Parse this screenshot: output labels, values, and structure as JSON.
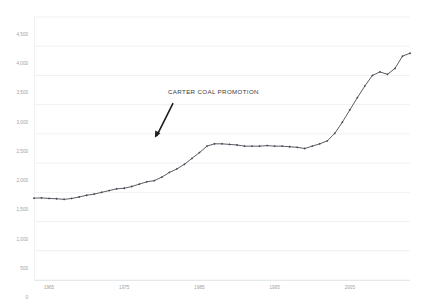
{
  "chart_data": {
    "type": "line",
    "title": "",
    "xlabel": "",
    "ylabel": "",
    "ylim": [
      0,
      4500
    ],
    "xlim": [
      1963,
      2013
    ],
    "grid": true,
    "legend": false,
    "yticks": [
      "0",
      "500",
      "1,000",
      "1,500",
      "2,000",
      "2,500",
      "3,000",
      "3,500",
      "4,000",
      "4,500"
    ],
    "ytick_values": [
      0,
      500,
      1000,
      1500,
      2000,
      2500,
      3000,
      3500,
      4000,
      4500
    ],
    "xticks": [
      "1965",
      "1975",
      "1985",
      "1995",
      "2005"
    ],
    "xtick_values": [
      1965,
      1975,
      1985,
      1995,
      2005
    ],
    "marker": "diamond",
    "line_color": "#4a4a55",
    "grid_color": "#eceef0",
    "tick_color": "#a0a0a0",
    "x": [
      1963,
      1964,
      1965,
      1966,
      1967,
      1968,
      1969,
      1970,
      1971,
      1972,
      1973,
      1974,
      1975,
      1976,
      1977,
      1978,
      1979,
      1980,
      1981,
      1982,
      1983,
      1984,
      1985,
      1986,
      1987,
      1988,
      1989,
      1990,
      1991,
      1992,
      1993,
      1994,
      1995,
      1996,
      1997,
      1998,
      1999,
      2000,
      2001,
      2002,
      2003,
      2004,
      2005,
      2006,
      2007,
      2008,
      2009,
      2010,
      2011,
      2012,
      2013
    ],
    "values": [
      1400,
      1405,
      1395,
      1390,
      1380,
      1395,
      1420,
      1450,
      1470,
      1500,
      1530,
      1560,
      1570,
      1600,
      1640,
      1680,
      1700,
      1760,
      1840,
      1900,
      1980,
      2080,
      2180,
      2290,
      2330,
      2330,
      2320,
      2310,
      2290,
      2290,
      2290,
      2300,
      2290,
      2290,
      2280,
      2270,
      2250,
      2290,
      2330,
      2380,
      2510,
      2700,
      2910,
      3120,
      3320,
      3500,
      3560,
      3520,
      3620,
      3830,
      3880
    ],
    "annotations": [
      {
        "text": "CARTER COAL PROMOTION",
        "target_x": 1979,
        "target_y": 2350,
        "arrow": true
      }
    ]
  },
  "page": {
    "background": "#ffffff"
  }
}
